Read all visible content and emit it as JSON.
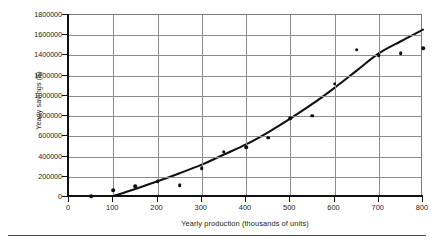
{
  "chart_data": {
    "type": "scatter",
    "title": "",
    "xlabel": "Yearly production (thousands of units)",
    "ylabel": "Yearly savings ($)",
    "xlim": [
      0,
      800
    ],
    "ylim": [
      0,
      1800000
    ],
    "grid": true,
    "legend": null,
    "xticks": [
      0,
      100,
      200,
      300,
      400,
      500,
      600,
      700,
      800
    ],
    "xtick_labels": [
      "0",
      "100",
      "200",
      "300",
      "400",
      "500",
      "600",
      "700",
      "800"
    ],
    "yticks": [
      0,
      200000,
      400000,
      600000,
      800000,
      1000000,
      1200000,
      1400000,
      1600000,
      1800000
    ],
    "ytick_labels": [
      "0",
      "200000",
      "400000",
      "600000",
      "800000",
      "1000000",
      "1200000",
      "1400000",
      "1600000",
      "1800000"
    ],
    "series": [
      {
        "name": "observed savings",
        "type": "scatter",
        "marker": "circle",
        "color": "#0d0d0d",
        "x": [
          50,
          100,
          150,
          200,
          250,
          300,
          350,
          400,
          450,
          500,
          550,
          600,
          650,
          700,
          750,
          800
        ],
        "y": [
          5000,
          65000,
          105000,
          155000,
          115000,
          285000,
          450000,
          490000,
          585000,
          780000,
          805000,
          1120000,
          1455000,
          1405000,
          1425000,
          1470000
        ]
      },
      {
        "name": "fitted trend curve",
        "type": "line",
        "color": "#111111",
        "x": [
          100,
          150,
          200,
          250,
          300,
          350,
          400,
          450,
          500,
          550,
          600,
          650,
          700,
          750,
          800
        ],
        "y": [
          10000,
          80000,
          155000,
          235000,
          320000,
          420000,
          520000,
          640000,
          775000,
          920000,
          1080000,
          1250000,
          1420000,
          1540000,
          1655000
        ]
      }
    ]
  },
  "axes": {
    "y_title": "Yearly savings ($)",
    "x_title": "Yearly production (thousands of units)"
  }
}
